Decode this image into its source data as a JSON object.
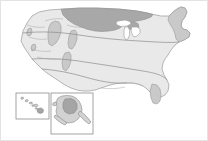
{
  "figure": {
    "frame_color": "#e3e3e3",
    "background_color": "#ffffff"
  },
  "legend_colors": {
    "land_base": "#e9e9e9",
    "region_mid": "#c9c9c9",
    "region_dark": "#a8a8a8",
    "region_darker": "#9b9b9b",
    "lake": "#ffffff",
    "outline": "#9a9a9a"
  },
  "main_map": {
    "name": "contiguous-united-states",
    "regions": [
      {
        "id": "base-landmass",
        "label": "Contiguous United States",
        "shade": "land-base"
      },
      {
        "id": "northern-plains-band",
        "label": "Northern Plains band",
        "shade": "region-dark"
      },
      {
        "id": "great-basin-patch",
        "label": "Great Basin patch",
        "shade": "region-mid"
      },
      {
        "id": "idaho-patch",
        "label": "Northern Rockies patch",
        "shade": "region-mid"
      },
      {
        "id": "colorado-patch",
        "label": "Central Rockies patch",
        "shade": "region-mid"
      },
      {
        "id": "northeast-band",
        "label": "Northeast band",
        "shade": "region-mid"
      },
      {
        "id": "florida-peninsula",
        "label": "Florida peninsula",
        "shade": "region-mid"
      },
      {
        "id": "gulf-coast-band",
        "label": "Gulf coast band",
        "shade": "land-base"
      }
    ],
    "lakes": [
      {
        "id": "lake-superior",
        "label": "Lake Superior"
      },
      {
        "id": "lake-michigan",
        "label": "Lake Michigan"
      },
      {
        "id": "lake-huron-erie",
        "label": "Lake Huron and Lake Erie"
      }
    ],
    "dividers": [
      {
        "id": "northern-boundary",
        "label": "Northern shading boundary"
      },
      {
        "id": "central-boundary",
        "label": "Central shading boundary"
      },
      {
        "id": "southern-boundary",
        "label": "Southern shading boundary"
      }
    ]
  },
  "insets": [
    {
      "id": "hawaii-inset",
      "name": "hawaii-inset",
      "label": "Hawaii",
      "islands": 7,
      "shade": "inset-land"
    },
    {
      "id": "alaska-inset",
      "name": "alaska-inset",
      "label": "Alaska",
      "shade": "inset-land",
      "highlight_shade": "inset-dark"
    }
  ]
}
